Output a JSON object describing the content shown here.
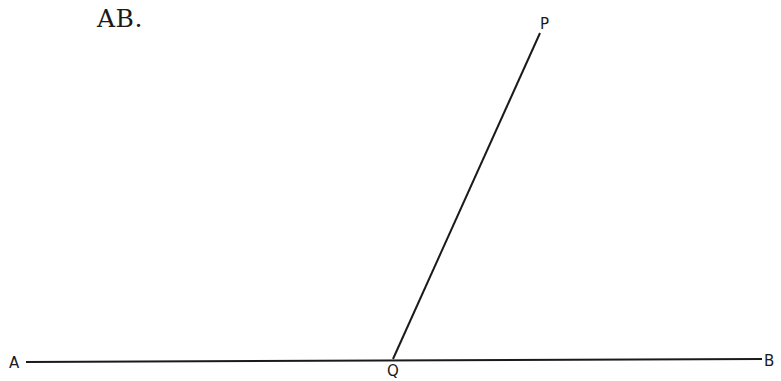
{
  "heading": "AB.",
  "diagram": {
    "points": {
      "A": {
        "label": "A",
        "x": 26,
        "y": 362
      },
      "B": {
        "label": "B",
        "x": 762,
        "y": 359
      },
      "Q": {
        "label": "Q",
        "x": 393,
        "y": 359
      },
      "P": {
        "label": "P",
        "x": 540,
        "y": 33
      }
    },
    "segments": [
      {
        "from": "A",
        "to": "B"
      },
      {
        "from": "Q",
        "to": "P"
      }
    ],
    "line_color": "#1a1a1a"
  }
}
